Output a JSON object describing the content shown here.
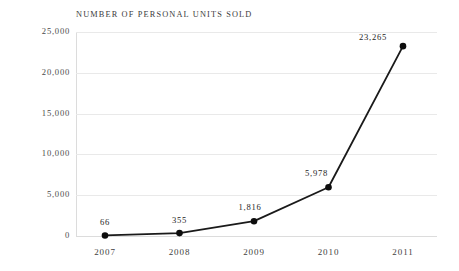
{
  "chart_data": {
    "type": "line",
    "title": "NUMBER OF PERSONAL UNITS SOLD",
    "xlabel": "",
    "ylabel": "",
    "categories": [
      "2007",
      "2008",
      "2009",
      "2010",
      "2011"
    ],
    "values": [
      66,
      355,
      1816,
      5978,
      23265
    ],
    "point_labels": [
      "66",
      "355",
      "1,816",
      "5,978",
      "23,265"
    ],
    "ylim": [
      0,
      25000
    ],
    "ytick_values": [
      25000,
      20000,
      15000,
      10000,
      5000,
      0
    ],
    "ytick_labels": [
      "25,000",
      "20,000",
      "15,000",
      "10,000",
      "5,000",
      "0"
    ],
    "grid": "horizontal",
    "legend": "none",
    "series": [
      {
        "name": "Personal units sold",
        "values": [
          66,
          355,
          1816,
          5978,
          23265
        ]
      }
    ],
    "colors": {
      "line": "#1a1a1a",
      "marker": "#0d0d0d",
      "gridline": "#e9e9e9",
      "axis": "#dcdcdc",
      "background": "#ffffff",
      "title_text": "#3b3b3b",
      "tick_text": "#4a4a4a",
      "label_text": "#1e1e1e"
    }
  }
}
